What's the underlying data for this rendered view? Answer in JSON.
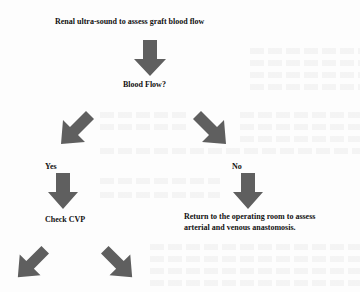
{
  "diagram": {
    "type": "flowchart",
    "colors": {
      "arrow_fill": "#5f5f5f",
      "text": "#111111",
      "background": "#fdfdfd"
    },
    "nodes": {
      "start": "Renal ultra-sound to assess graft blood flow",
      "decision": "Blood Flow?",
      "yes_label": "Yes",
      "no_label": "No",
      "yes_action": "Check CVP",
      "no_action_line1": "Return to the operating room to assess",
      "no_action_line2": "arterial and venous anastomosis."
    },
    "arrows": [
      {
        "id": "start-to-decision",
        "direction": "down"
      },
      {
        "id": "decision-to-yes",
        "direction": "down-left"
      },
      {
        "id": "decision-to-no",
        "direction": "down-right"
      },
      {
        "id": "yes-to-check-cvp",
        "direction": "down"
      },
      {
        "id": "no-to-return-or",
        "direction": "down"
      },
      {
        "id": "check-cvp-left",
        "direction": "down-left"
      },
      {
        "id": "check-cvp-right",
        "direction": "down-right"
      }
    ]
  }
}
